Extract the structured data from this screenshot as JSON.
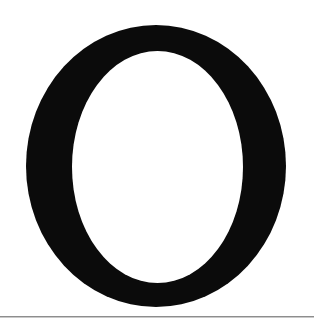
{
  "page": {
    "width": 314,
    "height": 324,
    "background_color": "#ffffff"
  },
  "glyph": {
    "character": "O",
    "name": "capital-letter-o",
    "style": "serif-dropcap",
    "ink_color": "#0b0b0b",
    "counter_color": "#ffffff",
    "outer_left": 26,
    "outer_top": 25,
    "outer_width": 260,
    "outer_height": 282,
    "counter_left": 72,
    "counter_top": 51,
    "counter_width": 171,
    "counter_height": 232,
    "stroke_thick_px": 46,
    "stroke_thin_px": 25
  },
  "rule": {
    "name": "page-rule",
    "color": "#8d8d8d",
    "shadow_color": "#c9c9c9",
    "top": 316,
    "thickness": 1
  }
}
